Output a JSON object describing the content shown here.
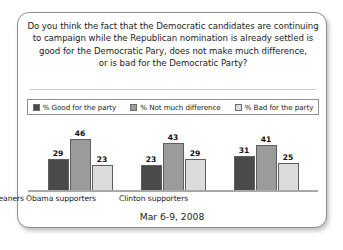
{
  "question": {
    "lines": [
      "Do you think the fact that the Democratic candidates are continuing",
      "to campaign while the Republican nomination is already settled is",
      "good for the Democratic Pary, does not make much difference,",
      "or is bad for the Democratic Party?"
    ]
  },
  "footer": {
    "date": "Mar 6-9, 2008"
  },
  "legend": {
    "items": [
      {
        "label": "% Good for the party",
        "color": "#4a4a4a"
      },
      {
        "label": "% Not much difference",
        "color": "#9b9b9b"
      },
      {
        "label": "% Bad for the party",
        "color": "#dcdcdc"
      }
    ]
  },
  "chart_data": {
    "type": "bar",
    "subtitle": "Mar 6-9, 2008",
    "xlabel": "",
    "ylabel": "",
    "ylim": [
      0,
      50
    ],
    "grid": false,
    "legend_position": "top",
    "categories": [
      "Total Democrats/leaners",
      "Obama supporters",
      "Clinton supporters"
    ],
    "series": [
      {
        "name": "% Good for the party",
        "color": "#4a4a4a",
        "values": [
          29,
          23,
          31
        ]
      },
      {
        "name": "% Not much difference",
        "color": "#9b9b9b",
        "values": [
          46,
          43,
          41
        ]
      },
      {
        "name": "% Bad for the party",
        "color": "#dcdcdc",
        "values": [
          23,
          29,
          25
        ]
      }
    ]
  }
}
